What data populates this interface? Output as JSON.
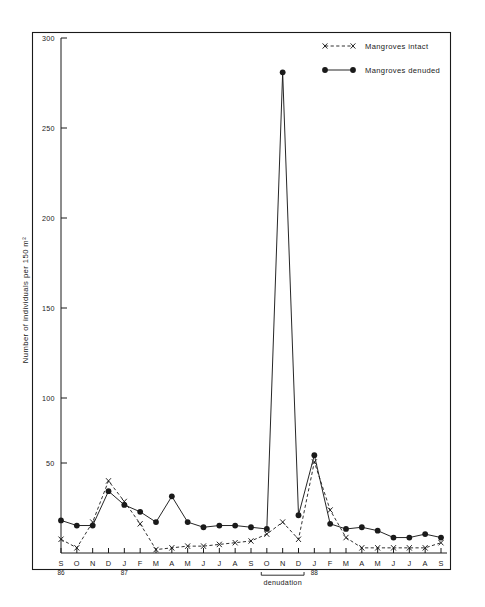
{
  "chart_data": {
    "type": "line",
    "title": "",
    "xlabel": "",
    "ylabel": "Number  of  individuals  per  150 m²",
    "ylim": [
      0,
      300
    ],
    "yticks": [
      0,
      50,
      100,
      150,
      200,
      250,
      300
    ],
    "ytick_labels": [
      "",
      "50",
      "100",
      "150",
      "200",
      "250",
      "300"
    ],
    "grid": false,
    "legend_position": "top-right",
    "categories": [
      "S",
      "O",
      "N",
      "D",
      "J",
      "F",
      "M",
      "A",
      "M",
      "J",
      "J",
      "A",
      "S",
      "O",
      "N",
      "D",
      "J",
      "F",
      "M",
      "A",
      "M",
      "J",
      "J",
      "A",
      "S"
    ],
    "year_markers": [
      {
        "index": 0,
        "label": "86"
      },
      {
        "index": 4,
        "label": "87"
      },
      {
        "index": 16,
        "label": "88"
      }
    ],
    "annotations": [
      {
        "label": "denudation",
        "from_index": 13,
        "to_index": 15
      }
    ],
    "series": [
      {
        "name": "Mangroves  intact",
        "marker": "x",
        "linestyle": "dashed",
        "values": [
          8,
          3,
          18,
          42,
          30,
          17,
          2,
          3,
          4,
          4,
          5,
          6,
          7,
          11,
          18,
          8,
          53,
          25,
          9,
          3,
          3,
          3,
          3,
          3,
          6
        ]
      },
      {
        "name": "Mangroves  denuded",
        "marker": "circle",
        "linestyle": "solid",
        "values": [
          19,
          16,
          16,
          36,
          28,
          24,
          18,
          33,
          18,
          15,
          16,
          16,
          15,
          14,
          280,
          22,
          57,
          17,
          14,
          15,
          13,
          9,
          9,
          11,
          9
        ]
      }
    ]
  },
  "legend": {
    "entries": [
      {
        "label": "Mangroves     intact",
        "style": "dashed-x"
      },
      {
        "label": "Mangroves     denuded",
        "style": "solid-dot"
      }
    ]
  },
  "colors": {
    "ink": "#1a1a1a",
    "background": "#ffffff"
  }
}
